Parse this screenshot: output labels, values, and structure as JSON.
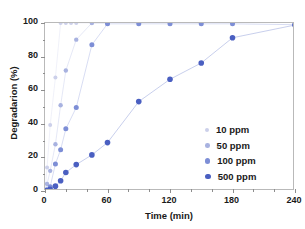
{
  "chart_data": {
    "type": "scatter",
    "title": "",
    "xlabel": "Time (min)",
    "ylabel": "Degradarion (%)",
    "xlim": [
      0,
      240
    ],
    "ylim": [
      0,
      100
    ],
    "xticks": [
      0,
      60,
      120,
      180,
      240
    ],
    "yticks": [
      0,
      20,
      40,
      60,
      80,
      100
    ],
    "x_minor_interval": 20,
    "y_minor_interval": 10,
    "grid": false,
    "legend_position": "lower right",
    "marker": "circle",
    "connector_lines": true,
    "series": [
      {
        "name": "10 ppm",
        "color": "#ccd0ea",
        "marker_size": 4.0,
        "x": [
          0,
          2,
          5,
          10,
          15,
          20,
          25,
          30,
          45,
          60
        ],
        "y": [
          0,
          14.0,
          39.3,
          67.6,
          100,
          100,
          100,
          100,
          100,
          100
        ]
      },
      {
        "name": "50 ppm",
        "color": "#a8b2e0",
        "marker_size": 4.4,
        "x": [
          0,
          2,
          5,
          10,
          15,
          20,
          30,
          45,
          60
        ],
        "y": [
          0,
          4.2,
          12.0,
          27.8,
          51.0,
          71.7,
          90.1,
          100,
          100
        ]
      },
      {
        "name": "100 ppm",
        "color": "#7d8ed6",
        "marker_size": 5.0,
        "x": [
          0,
          2,
          5,
          10,
          15,
          20,
          30,
          45,
          60,
          90,
          120,
          150,
          180,
          240
        ],
        "y": [
          0,
          0.8,
          2.6,
          16.1,
          24.6,
          37.0,
          49.7,
          87.0,
          99.5,
          99.5,
          99.5,
          99.5,
          99.5,
          99.0
        ]
      },
      {
        "name": "500 ppm",
        "color": "#4a5fc1",
        "marker_size": 5.6,
        "x": [
          0,
          2,
          5,
          10,
          15,
          20,
          30,
          45,
          60,
          90,
          120,
          150,
          180,
          240
        ],
        "y": [
          0,
          0.3,
          1.0,
          2.9,
          6.1,
          11.0,
          15.7,
          21.5,
          28.8,
          53.2,
          66.5,
          76.2,
          91.2,
          98.8
        ]
      }
    ]
  },
  "legend": {
    "entries": [
      {
        "label": "10 ppm",
        "color": "#ccd0ea",
        "size": 4.0
      },
      {
        "label": "50 ppm",
        "color": "#a8b2e0",
        "size": 4.6
      },
      {
        "label": "100 ppm",
        "color": "#7d8ed6",
        "size": 5.2
      },
      {
        "label": "500 ppm",
        "color": "#4a5fc1",
        "size": 5.8
      }
    ]
  },
  "axes": {
    "x_tick_labels": [
      "0",
      "60",
      "120",
      "180",
      "240"
    ],
    "y_tick_labels": [
      "0",
      "20",
      "40",
      "60",
      "80",
      "100"
    ],
    "frame_color": "#b9b9b9",
    "tick_color": "#8d8d8d",
    "text_color": "#1a1a1a",
    "background": "#ffffff"
  }
}
